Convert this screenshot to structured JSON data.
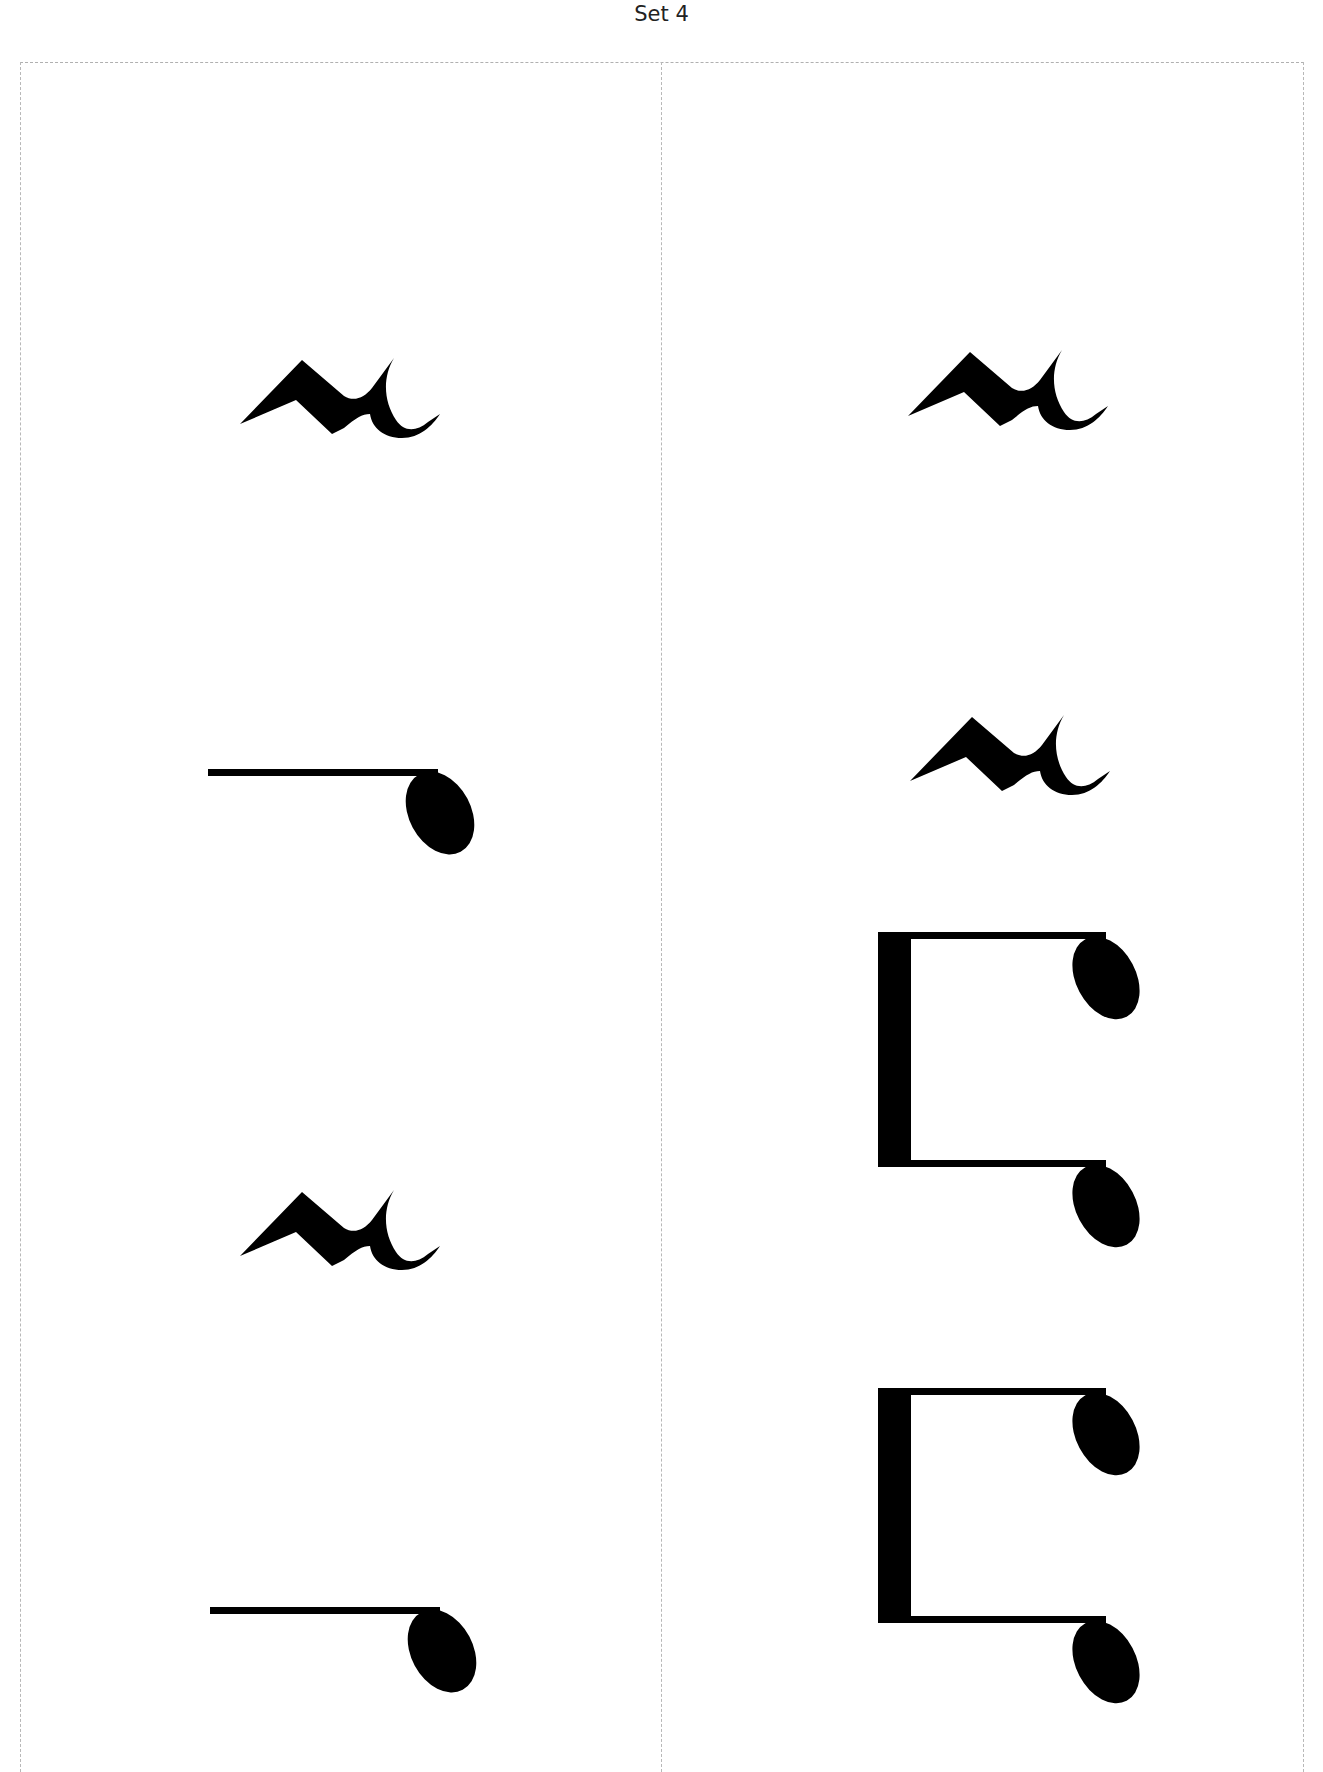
{
  "page": {
    "title": "Set 4",
    "ink_color": "#000000",
    "cut_line_color": "#b8b8b8"
  },
  "cards": [
    {
      "position": "left",
      "symbols": [
        {
          "type": "quarter-rest",
          "orientation": "rotated-90"
        },
        {
          "type": "eighth-note",
          "orientation": "rotated-90"
        },
        {
          "type": "quarter-rest",
          "orientation": "rotated-90"
        },
        {
          "type": "eighth-note",
          "orientation": "rotated-90"
        }
      ]
    },
    {
      "position": "right",
      "symbols": [
        {
          "type": "quarter-rest",
          "orientation": "rotated-90"
        },
        {
          "type": "quarter-rest",
          "orientation": "rotated-90"
        },
        {
          "type": "beamed-eighth-notes",
          "orientation": "rotated-90"
        },
        {
          "type": "beamed-eighth-notes",
          "orientation": "rotated-90"
        }
      ]
    }
  ]
}
